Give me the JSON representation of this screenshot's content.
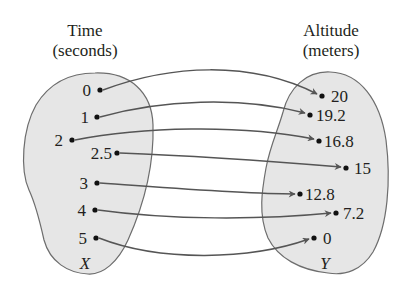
{
  "domain": {
    "title_line1": "Time",
    "title_line2": "(seconds)",
    "set_name": "X",
    "elements": [
      {
        "label": "0",
        "x": 100,
        "y": 90
      },
      {
        "label": "1",
        "x": 97,
        "y": 117
      },
      {
        "label": "2",
        "x": 72,
        "y": 140
      },
      {
        "label": "2.5",
        "x": 117,
        "y": 153
      },
      {
        "label": "3",
        "x": 97,
        "y": 183
      },
      {
        "label": "4",
        "x": 95,
        "y": 210
      },
      {
        "label": "5",
        "x": 96,
        "y": 238
      }
    ]
  },
  "range": {
    "title_line1": "Altitude",
    "title_line2": "(meters)",
    "set_name": "Y",
    "elements": [
      {
        "label": "20",
        "x": 322,
        "y": 96
      },
      {
        "label": "19.2",
        "x": 310,
        "y": 115
      },
      {
        "label": "16.8",
        "x": 319,
        "y": 141
      },
      {
        "label": "15",
        "x": 346,
        "y": 168
      },
      {
        "label": "12.8",
        "x": 300,
        "y": 194
      },
      {
        "label": "7.2",
        "x": 336,
        "y": 213
      },
      {
        "label": "0",
        "x": 314,
        "y": 238
      }
    ]
  },
  "mapping": [
    {
      "from": "0",
      "to": "20"
    },
    {
      "from": "1",
      "to": "19.2"
    },
    {
      "from": "2",
      "to": "16.8"
    },
    {
      "from": "2.5",
      "to": "15"
    },
    {
      "from": "3",
      "to": "12.8"
    },
    {
      "from": "4",
      "to": "7.2"
    },
    {
      "from": "5",
      "to": "0"
    }
  ],
  "colors": {
    "blob_fill": "#e6e6e6",
    "blob_stroke": "#6d6d6d",
    "arrow": "#555555",
    "text": "#231f20",
    "dot": "#111111"
  }
}
